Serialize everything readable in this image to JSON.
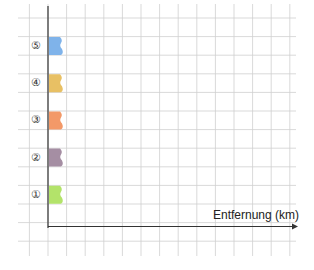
{
  "diagram": {
    "x_axis_label": "Entfernung (km)",
    "rows": [
      {
        "marker": "⑤",
        "color": "#7fb3ea",
        "name": "row-5"
      },
      {
        "marker": "④",
        "color": "#e8c064",
        "name": "row-4"
      },
      {
        "marker": "③",
        "color": "#f39968",
        "name": "row-3"
      },
      {
        "marker": "②",
        "color": "#a58ea3",
        "name": "row-2"
      },
      {
        "marker": "①",
        "color": "#b3e36a",
        "name": "row-1"
      }
    ],
    "grid_color": "#cfcfcf",
    "axis_color": "#333333"
  }
}
